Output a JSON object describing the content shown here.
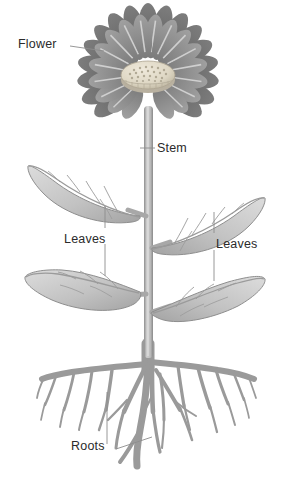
{
  "diagram": {
    "background_color": "#ffffff",
    "label_color": "#2b2b2b",
    "leader_line_color": "#8c8c8c",
    "palette": {
      "petal_back": "#6e6e6e",
      "petal_front": "#8f8f8f",
      "petal_highlight": "#c5c5c5",
      "flower_center": "#ded8c8",
      "flower_center_dots": "#a49c88",
      "leaf_light": "#d2d2d2",
      "leaf_mid": "#b6b6b6",
      "leaf_dark": "#9a9a9a",
      "leaf_outline": "#8a8a8a",
      "vein": "#9b9b9b",
      "stem_light": "#c9c9c9",
      "stem_edge": "#8e8e8e",
      "root_fill": "#9c9c9c",
      "root_edge": "#7d7d7d"
    },
    "labels": [
      {
        "id": "flower",
        "text": "Flower",
        "points_to": "flower-head",
        "x": 18,
        "y": 38,
        "leader": "from text right edge at (70,46) to flower petal edge at (104,50)"
      },
      {
        "id": "stem",
        "text": "Stem",
        "points_to": "stem",
        "x": 157,
        "y": 142,
        "leader": "from stem at (140,148) horizontally right to text at (155,148)"
      },
      {
        "id": "leaves-left",
        "text": "Leaves",
        "points_to": "upper-left-leaf and lower-left-leaf",
        "x": 64,
        "y": 233,
        "leader": "vertical line at x=105 from y=205 down to y=275, passing beside the text"
      },
      {
        "id": "leaves-right",
        "text": "Leaves",
        "points_to": "upper-right-leaf and lower-right-leaf",
        "x": 216,
        "y": 238,
        "leader": "vertical line at x=214 from y=212 down to y=280, passing beside the text"
      },
      {
        "id": "roots",
        "text": "Roots",
        "points_to": "root-system",
        "x": 71,
        "y": 440,
        "leader": "from text right at (116,448) to root branch at (152,437), plus vertical tick at x=107 up to y=392"
      }
    ],
    "parts": [
      {
        "id": "flower-head",
        "name": "Flower",
        "description": "daisy-like composite flower head with two rings of elongated petals and a textured domed center disc",
        "center_x": 148,
        "center_y": 74,
        "radius": 62,
        "petal_count_back": 22,
        "petal_count_front": 20,
        "center_radius": 27
      },
      {
        "id": "stem",
        "name": "Stem",
        "description": "straight vertical stalk from the flower head down to the root crown",
        "top_y": 108,
        "bottom_y": 355,
        "x": 145,
        "width": 9
      },
      {
        "id": "upper-left-leaf",
        "name": "Leaf",
        "description": "lance-shaped leaf angled up and to the left with midrib and pinnate side veins",
        "tip_x": 28,
        "tip_y": 166,
        "base_x": 142,
        "base_y": 214
      },
      {
        "id": "upper-right-leaf",
        "name": "Leaf",
        "description": "lance-shaped leaf angled up and to the right with midrib and pinnate side veins",
        "tip_x": 266,
        "tip_y": 196,
        "base_x": 150,
        "base_y": 246
      },
      {
        "id": "lower-left-leaf",
        "name": "Leaf",
        "description": "broad leaf extending left and slightly down from the stem",
        "tip_x": 25,
        "tip_y": 296,
        "base_x": 140,
        "base_y": 292
      },
      {
        "id": "lower-right-leaf",
        "name": "Leaf",
        "description": "broad leaf extending right and slightly down from the stem",
        "tip_x": 266,
        "tip_y": 268,
        "base_x": 150,
        "base_y": 312
      },
      {
        "id": "root-system",
        "name": "Roots",
        "description": "spreading fibrous taproot system branching repeatedly into fine rootlets",
        "crown_x": 148,
        "crown_y": 352,
        "spread_left": 38,
        "spread_right": 262,
        "depth_y": 470
      }
    ]
  }
}
